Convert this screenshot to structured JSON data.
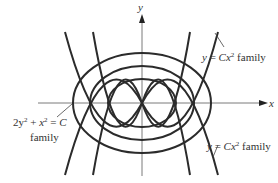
{
  "diagram": {
    "axes": {
      "x_label": "x",
      "y_label": "y"
    },
    "labels": {
      "parabola_top": {
        "var": "y",
        "eq": " = ",
        "coef": "Cx",
        "exp": "2",
        "word": " family"
      },
      "parabola_bottom": {
        "var": "y",
        "eq": " = ",
        "coef": "Cx",
        "exp": "2",
        "word": " family"
      },
      "ellipse": {
        "line1_a": "2y",
        "line1_a_exp": "2",
        "line1_plus": " + ",
        "line1_b": "x",
        "line1_b_exp": "2",
        "line1_eq": " = ",
        "line1_c": "C",
        "line2": "family"
      }
    },
    "families": [
      {
        "name": "ellipse-family",
        "equation": "2y^2 + x^2 = C",
        "count": 3
      },
      {
        "name": "parabola-family",
        "equation": "y = Cx^2",
        "count": 4
      }
    ],
    "colors": {
      "curve": "#2b2b2b",
      "axis": "#7a7a7a",
      "text": "#333333"
    }
  }
}
